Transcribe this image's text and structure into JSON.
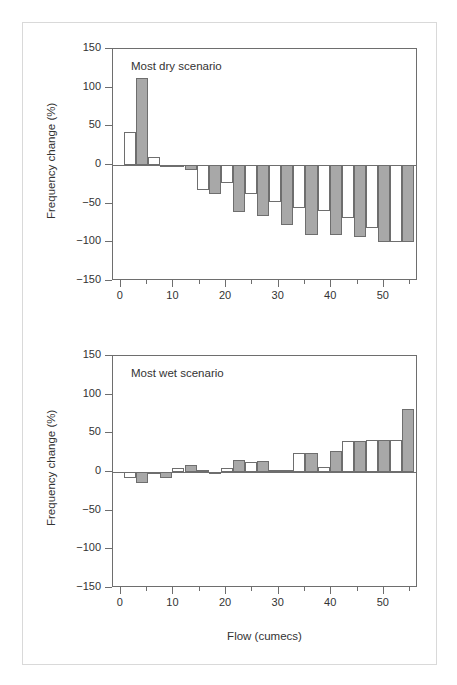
{
  "figure": {
    "border_color": "#d9d9d9",
    "bar_fill_gray": "#a8a8a8",
    "bar_fill_white": "#ffffff",
    "bar_edge": "#6e6e6e"
  },
  "axis": {
    "ylabel": "Frequency change (%)",
    "xlabel": "Flow (cumecs)",
    "ytick_labels": [
      "150",
      "100",
      "50",
      "0",
      "−50",
      "−100",
      "−150"
    ],
    "ytick_values": [
      150,
      100,
      50,
      0,
      -50,
      -100,
      -150
    ],
    "xtick_labels": [
      "0",
      "10",
      "20",
      "30",
      "40",
      "50"
    ],
    "xtick_values": [
      0,
      10,
      20,
      30,
      40,
      50
    ],
    "xminor_values": [
      5,
      15,
      25,
      35,
      45,
      55
    ],
    "ylim": [
      -150,
      150
    ],
    "xlim": [
      -1.5,
      56.5
    ]
  },
  "panels": [
    {
      "id": "top",
      "annotation": "Most dry scenario"
    },
    {
      "id": "bottom",
      "annotation": "Most wet scenario"
    }
  ],
  "chart_data": [
    {
      "type": "bar",
      "title": "Most dry scenario",
      "xlabel": "Flow (cumecs)",
      "ylabel": "Frequency change (%)",
      "xlim": [
        -1.5,
        56.5
      ],
      "ylim": [
        -150,
        150
      ],
      "grid": false,
      "legend": "none",
      "bar_width": 2.3,
      "series": [
        {
          "name": "white",
          "fill": "#ffffff",
          "x": [
            0.6,
            5.2,
            9.8,
            14.4,
            19.0,
            23.6,
            28.2,
            32.8,
            37.4,
            42.0,
            46.6,
            51.2
          ],
          "values": [
            43,
            10,
            -3,
            -32,
            -23,
            -38,
            -48,
            -56,
            -59,
            -69,
            -82,
            -100
          ]
        },
        {
          "name": "gray",
          "fill": "#a8a8a8",
          "x": [
            2.9,
            7.5,
            12.1,
            16.7,
            21.3,
            25.9,
            30.5,
            35.1,
            39.7,
            44.3,
            48.9,
            53.5
          ],
          "values": [
            112,
            -2,
            -6,
            -37,
            -61,
            -66,
            -78,
            -90,
            -90,
            -93,
            -99,
            -99
          ]
        }
      ]
    },
    {
      "type": "bar",
      "title": "Most wet scenario",
      "xlabel": "Flow (cumecs)",
      "ylabel": "Frequency change (%)",
      "xlim": [
        -1.5,
        56.5
      ],
      "ylim": [
        -150,
        150
      ],
      "grid": false,
      "legend": "none",
      "bar_width": 2.3,
      "series": [
        {
          "name": "white",
          "fill": "#ffffff",
          "x": [
            0.6,
            5.2,
            9.8,
            14.4,
            19.0,
            23.6,
            28.2,
            32.8,
            37.4,
            42.0,
            46.6,
            51.2
          ],
          "values": [
            -8,
            -1,
            5,
            2,
            5,
            13,
            3,
            24,
            7,
            40,
            41,
            41
          ]
        },
        {
          "name": "gray",
          "fill": "#a8a8a8",
          "x": [
            2.9,
            7.5,
            12.1,
            16.7,
            21.3,
            25.9,
            30.5,
            35.1,
            39.7,
            44.3,
            48.9,
            53.5
          ],
          "values": [
            -14,
            -8,
            9,
            -2,
            16,
            14,
            3,
            24,
            27,
            40,
            41,
            82
          ]
        }
      ]
    }
  ]
}
